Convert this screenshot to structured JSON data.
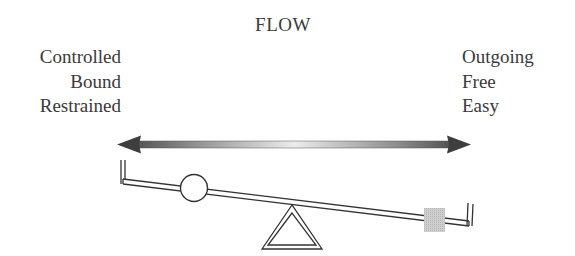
{
  "title": "FLOW",
  "left_labels": [
    "Controlled",
    "Bound",
    "Restrained"
  ],
  "right_labels": [
    "Outgoing",
    "Free",
    "Easy"
  ],
  "colors": {
    "text": "#3a3a3a",
    "arrow_dark": "#4a4a4a",
    "arrow_light": "#e8e8e8",
    "line": "#333333",
    "weight_square": "#c8c8c8"
  },
  "diagram": {
    "arrow": "bidirectional gradient arrow",
    "seesaw_tilt": "right side down",
    "left_weight": "circle (light)",
    "right_weight": "square (heavy)"
  }
}
